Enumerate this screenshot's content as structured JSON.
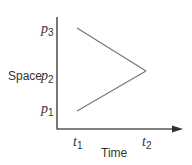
{
  "diagram": {
    "y_axis_label": "Space",
    "x_axis_label": "Time",
    "y_ticks": [
      {
        "symbol": "p",
        "sub": "3"
      },
      {
        "symbol": "p",
        "sub": "2"
      },
      {
        "symbol": "p",
        "sub": "1"
      }
    ],
    "x_ticks": [
      {
        "symbol": "t",
        "sub": "1"
      },
      {
        "symbol": "t",
        "sub": "2"
      }
    ],
    "lines": [
      {
        "from": "(t1, p3)",
        "to": "(t2, p2)"
      },
      {
        "from": "(t1, p1)",
        "to": "(t2, p2)"
      }
    ],
    "colors": {
      "axis": "#555555",
      "line": "#777777",
      "text": "#333333"
    }
  }
}
